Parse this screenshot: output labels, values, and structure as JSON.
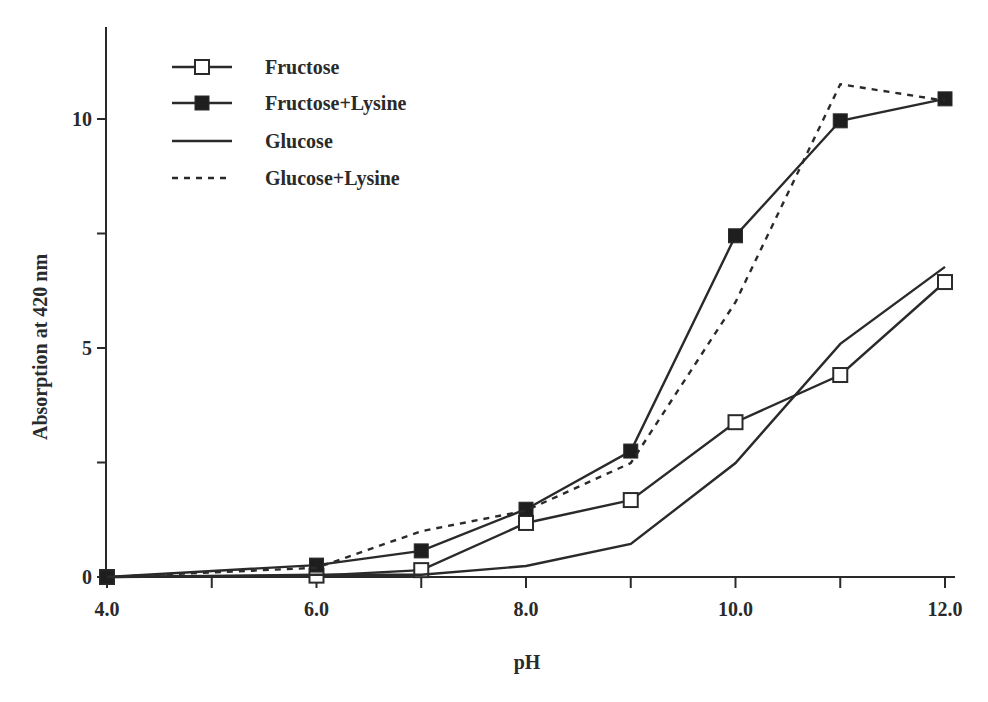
{
  "chart_data": {
    "type": "line",
    "title": "",
    "xlabel": "pH",
    "ylabel": "Absorption at 420 nm",
    "xlim": [
      4.0,
      12.0
    ],
    "ylim": [
      0,
      12
    ],
    "x_ticks": [
      4.0,
      5.0,
      6.0,
      7.0,
      8.0,
      9.0,
      10.0,
      11.0,
      12.0
    ],
    "x_tick_labels": [
      "4.0",
      "",
      "6.0",
      "",
      "8.0",
      "",
      "10.0",
      "",
      "12.0"
    ],
    "y_ticks": [
      0,
      2.5,
      5,
      7.5,
      10
    ],
    "y_tick_labels": [
      "0",
      "",
      "5",
      "",
      "10"
    ],
    "grid": false,
    "legend_position": "upper-left",
    "x": [
      4.0,
      6.0,
      7.0,
      8.0,
      9.0,
      10.0,
      11.0,
      12.0
    ],
    "series": [
      {
        "name": "Fructose",
        "style": "solid",
        "marker": "open-square",
        "values": [
          0.0,
          0.03,
          0.15,
          1.18,
          1.68,
          3.38,
          4.41,
          6.44
        ]
      },
      {
        "name": "Fructose+Lysine",
        "style": "solid",
        "marker": "filled-square",
        "values": [
          0.0,
          0.26,
          0.57,
          1.48,
          2.75,
          7.45,
          9.96,
          10.44
        ]
      },
      {
        "name": "Glucose",
        "style": "solid",
        "marker": "none",
        "values": [
          0.0,
          0.05,
          0.05,
          0.24,
          0.72,
          2.49,
          5.09,
          6.77
        ]
      },
      {
        "name": "Glucose+Lysine",
        "style": "dashed",
        "marker": "none",
        "values": [
          0.0,
          0.2,
          1.0,
          1.45,
          2.49,
          6.0,
          10.76,
          10.4
        ]
      }
    ]
  },
  "legend": {
    "items": [
      {
        "label": "Fructose"
      },
      {
        "label": "Fructose+Lysine"
      },
      {
        "label": "Glucose"
      },
      {
        "label": "Glucose+Lysine"
      }
    ]
  },
  "axes": {
    "x_title": "pH",
    "y_title": "Absorption at 420 nm"
  },
  "colors": {
    "line": "#2a2a2a",
    "background": "#ffffff"
  }
}
